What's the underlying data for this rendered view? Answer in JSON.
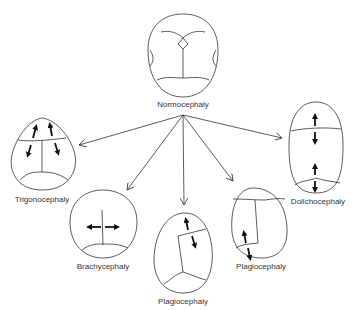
{
  "diagram": {
    "center": {
      "label": "Normocephaly"
    },
    "variants": [
      {
        "id": "trigonocephaly",
        "label": "Trigonocephaly"
      },
      {
        "id": "brachycephaly",
        "label": "Brachycephaly"
      },
      {
        "id": "plagiocephaly-frontal",
        "label": "Plagiocephaly"
      },
      {
        "id": "plagiocephaly-occipital",
        "label": "Plagiocephaly"
      },
      {
        "id": "dolichocephaly",
        "label": "Dolichocephaly"
      }
    ],
    "colors": {
      "line": "#333333",
      "arrow": "#111111",
      "background": "#ffffff"
    }
  }
}
